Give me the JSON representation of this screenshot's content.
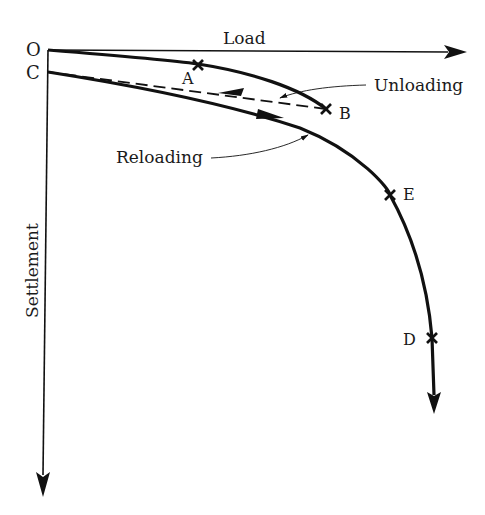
{
  "diagram": {
    "axes": {
      "x_label": "Load",
      "y_label": "Settlement",
      "origin_label": "O"
    },
    "points": {
      "O": "O",
      "C": "C",
      "A": "A",
      "B": "B",
      "E": "E",
      "D": "D"
    },
    "annotations": {
      "unloading": "Unloading",
      "reloading": "Reloading"
    },
    "colors": {
      "line": "#111111",
      "background": "#ffffff"
    }
  }
}
